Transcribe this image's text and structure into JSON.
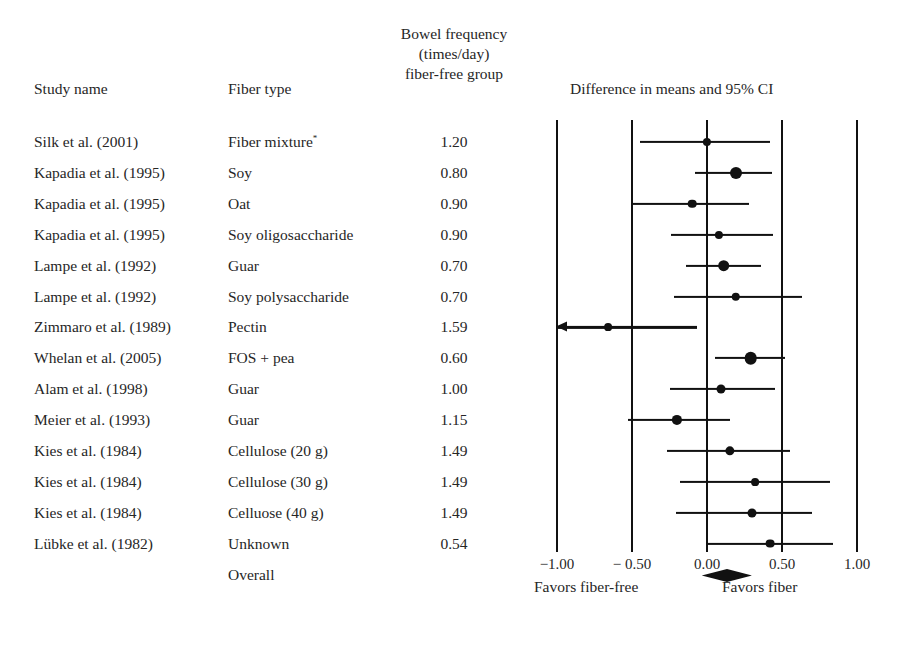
{
  "headers": {
    "study": "Study name",
    "fiber": "Fiber type",
    "bowel_line1": "Bowel frequency",
    "bowel_line2": "(times/day)",
    "bowel_line3": "fiber-free group",
    "plot": "Difference in means and 95% CI"
  },
  "axis": {
    "ticks": [
      "−1.00",
      "− 0.50",
      "0.00",
      "0.50",
      "1.00"
    ],
    "tick_values": [
      -1.0,
      -0.5,
      0.0,
      0.5,
      1.0
    ],
    "favors_left": "Favors fiber-free",
    "favors_right": "Favors fiber"
  },
  "rows": [
    {
      "study": "Silk et al. (2001)",
      "fiber": "Fiber mixture",
      "fiber_sup": "*",
      "value": "1.20"
    },
    {
      "study": "Kapadia et al. (1995)",
      "fiber": "Soy",
      "value": "0.80"
    },
    {
      "study": "Kapadia et al. (1995)",
      "fiber": "Oat",
      "value": "0.90"
    },
    {
      "study": "Kapadia et al. (1995)",
      "fiber": "Soy oligosaccharide",
      "value": "0.90"
    },
    {
      "study": "Lampe et al. (1992)",
      "fiber": "Guar",
      "value": "0.70"
    },
    {
      "study": "Lampe et al. (1992)",
      "fiber": "Soy polysaccharide",
      "value": "0.70"
    },
    {
      "study": "Zimmaro et al. (1989)",
      "fiber": "Pectin",
      "value": "1.59"
    },
    {
      "study": "Whelan et al. (2005)",
      "fiber": "FOS + pea",
      "value": "0.60"
    },
    {
      "study": "Alam et al. (1998)",
      "fiber": "Guar",
      "value": "1.00"
    },
    {
      "study": "Meier  et al. (1993)",
      "fiber": "Guar",
      "value": "1.15"
    },
    {
      "study": "Kies  et al. (1984)",
      "fiber": "Cellulose (20 g)",
      "value": "1.49"
    },
    {
      "study": "Kies et al. (1984)",
      "fiber": "Cellulose (30 g)",
      "value": "1.49"
    },
    {
      "study": "Kies et al. (1984)",
      "fiber": "Celluose (40 g)",
      "value": "1.49"
    },
    {
      "study": "Lübke et al. (1982)",
      "fiber": "Unknown",
      "value": "0.54"
    },
    {
      "study": "",
      "fiber": "Overall",
      "value": ""
    }
  ],
  "chart_data": {
    "type": "forest",
    "title": "Difference in means and 95% CI",
    "xlabel": "",
    "xlim": [
      -1.18,
      1.0
    ],
    "xticks": [
      -1.0,
      -0.5,
      0.0,
      0.5,
      1.0
    ],
    "grid": true,
    "reference_line": 0.0,
    "effect_measure": "Difference in means",
    "studies": [
      {
        "label": "Silk et al. (2001) — Fiber mixture",
        "estimate": 0.0,
        "lower": -0.45,
        "upper": 0.42,
        "weight": 0.22,
        "truncated_left": false
      },
      {
        "label": "Kapadia et al. (1995) — Soy",
        "estimate": 0.19,
        "lower": -0.08,
        "upper": 0.43,
        "weight": 0.6,
        "truncated_left": false
      },
      {
        "label": "Kapadia et al. (1995) — Oat",
        "estimate": -0.1,
        "lower": -0.5,
        "upper": 0.28,
        "weight": 0.26,
        "truncated_left": false
      },
      {
        "label": "Kapadia et al. (1995) — Soy oligosaccharide",
        "estimate": 0.08,
        "lower": -0.24,
        "upper": 0.44,
        "weight": 0.22,
        "truncated_left": false
      },
      {
        "label": "Lampe et al. (1992) — Guar",
        "estimate": 0.11,
        "lower": -0.14,
        "upper": 0.36,
        "weight": 0.56,
        "truncated_left": false
      },
      {
        "label": "Lampe et al. (1992) — Soy polysaccharide",
        "estimate": 0.19,
        "lower": -0.22,
        "upper": 0.63,
        "weight": 0.25,
        "truncated_left": false
      },
      {
        "label": "Zimmaro et al. (1989) — Pectin",
        "estimate": -0.66,
        "lower": -1.18,
        "upper": -0.07,
        "weight": 0.18,
        "truncated_left": true
      },
      {
        "label": "Whelan et al. (2005) — FOS + pea",
        "estimate": 0.29,
        "lower": 0.05,
        "upper": 0.52,
        "weight": 0.66,
        "truncated_left": false
      },
      {
        "label": "Alam et al. (1998) — Guar",
        "estimate": 0.09,
        "lower": -0.25,
        "upper": 0.45,
        "weight": 0.3,
        "truncated_left": false
      },
      {
        "label": "Meier  et al. (1993) — Guar",
        "estimate": -0.2,
        "lower": -0.53,
        "upper": 0.15,
        "weight": 0.42,
        "truncated_left": false
      },
      {
        "label": "Kies  et al. (1984) — Cellulose (20 g)",
        "estimate": 0.15,
        "lower": -0.27,
        "upper": 0.55,
        "weight": 0.33,
        "truncated_left": false
      },
      {
        "label": "Kies et al. (1984) — Cellulose (30 g)",
        "estimate": 0.32,
        "lower": -0.18,
        "upper": 0.82,
        "weight": 0.18,
        "truncated_left": false
      },
      {
        "label": "Kies et al. (1984) — Celluose (40 g)",
        "estimate": 0.3,
        "lower": -0.21,
        "upper": 0.7,
        "weight": 0.3,
        "truncated_left": false
      },
      {
        "label": "Lübke et al. (1982) — Unknown",
        "estimate": 0.42,
        "lower": 0.0,
        "upper": 0.84,
        "weight": 0.28,
        "truncated_left": false
      }
    ],
    "overall": {
      "label": "Overall",
      "estimate": 0.13,
      "lower": 0.04,
      "upper": 0.23
    }
  }
}
